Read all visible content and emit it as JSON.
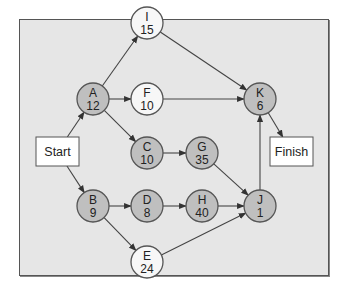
{
  "diagram": {
    "type": "activity-on-node network",
    "colors": {
      "panel_bg": "#e6e6e6",
      "panel_border": "#555555",
      "critical_node_fill": "#bfbfbf",
      "noncritical_node_fill": "#f7f7f7",
      "node_stroke": "#555555",
      "edge": "#444444",
      "box_fill": "#ffffff"
    },
    "start": {
      "label": "Start",
      "x": 57,
      "y": 151
    },
    "finish": {
      "label": "Finish",
      "x": 291,
      "y": 151
    },
    "nodes": [
      {
        "id": "A",
        "duration": "12",
        "x": 93,
        "y": 99,
        "critical": true
      },
      {
        "id": "I",
        "duration": "15",
        "x": 147,
        "y": 23,
        "critical": false
      },
      {
        "id": "F",
        "duration": "10",
        "x": 147,
        "y": 99,
        "critical": false
      },
      {
        "id": "K",
        "duration": "6",
        "x": 260,
        "y": 99,
        "critical": true
      },
      {
        "id": "C",
        "duration": "10",
        "x": 147,
        "y": 153,
        "critical": true
      },
      {
        "id": "G",
        "duration": "35",
        "x": 202,
        "y": 153,
        "critical": true
      },
      {
        "id": "B",
        "duration": "9",
        "x": 93,
        "y": 206,
        "critical": true
      },
      {
        "id": "D",
        "duration": "8",
        "x": 147,
        "y": 206,
        "critical": true
      },
      {
        "id": "H",
        "duration": "40",
        "x": 202,
        "y": 206,
        "critical": true
      },
      {
        "id": "J",
        "duration": "1",
        "x": 260,
        "y": 206,
        "critical": true
      },
      {
        "id": "E",
        "duration": "24",
        "x": 147,
        "y": 262,
        "critical": false
      }
    ],
    "edges": [
      {
        "from": "Start",
        "to": "A"
      },
      {
        "from": "Start",
        "to": "B"
      },
      {
        "from": "A",
        "to": "I"
      },
      {
        "from": "A",
        "to": "F"
      },
      {
        "from": "A",
        "to": "C"
      },
      {
        "from": "I",
        "to": "K"
      },
      {
        "from": "F",
        "to": "K"
      },
      {
        "from": "C",
        "to": "G"
      },
      {
        "from": "G",
        "to": "J"
      },
      {
        "from": "B",
        "to": "D"
      },
      {
        "from": "B",
        "to": "E"
      },
      {
        "from": "D",
        "to": "H"
      },
      {
        "from": "H",
        "to": "J"
      },
      {
        "from": "E",
        "to": "J"
      },
      {
        "from": "J",
        "to": "K"
      },
      {
        "from": "K",
        "to": "Finish"
      }
    ]
  }
}
